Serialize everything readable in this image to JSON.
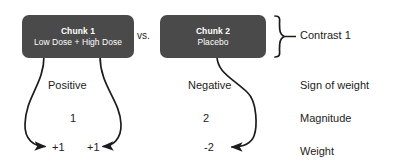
{
  "diagram": {
    "chunks": [
      {
        "title": "Chunk 1",
        "subtitle": "Low Dose + High Dose"
      },
      {
        "title": "Chunk 2",
        "subtitle": "Placebo"
      }
    ],
    "comparator": "vs.",
    "contrast_label": "Contrast 1",
    "row_labels": {
      "sign": "Sign of weight",
      "magnitude": "Magnitude",
      "weight": "Weight"
    },
    "signs": {
      "positive": "Positive",
      "negative": "Negative"
    },
    "magnitudes": {
      "left": "1",
      "right": "2"
    },
    "weights": {
      "left_a": "+1",
      "left_b": "+1",
      "right": "-2"
    },
    "colors": {
      "box_fill": "#4a4a4a",
      "box_text": "#ffffff",
      "stroke": "#1c1c1c",
      "background": "#ffffff"
    }
  }
}
